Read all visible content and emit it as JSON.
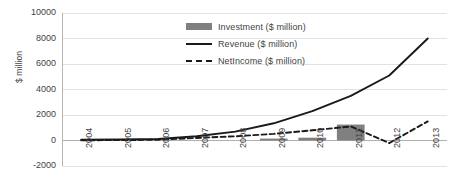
{
  "chart_data": {
    "type": "line",
    "title": "",
    "xlabel": "",
    "ylabel": "$ million",
    "ylim": [
      -2000,
      10000
    ],
    "ytick_step": 2000,
    "grid": true,
    "legend_position": "top-center",
    "categories": [
      "2004",
      "2005",
      "2006",
      "2007",
      "2008",
      "2009",
      "2010",
      "2011",
      "2012",
      "2013"
    ],
    "yticks": [
      "10000",
      "8000",
      "6000",
      "4000",
      "2000",
      "0",
      "-2000"
    ],
    "ytick_values": [
      10000,
      8000,
      6000,
      4000,
      2000,
      0,
      -2000
    ],
    "series": [
      {
        "name": "Investment ($ million)",
        "type": "bar",
        "color": "#808080",
        "values": [
          0,
          0,
          0,
          0,
          0,
          150,
          220,
          1250,
          0,
          0
        ]
      },
      {
        "name": "Revenue ($ million)",
        "type": "line",
        "style": "solid",
        "color": "#1a1a1a",
        "values": [
          60,
          80,
          120,
          330,
          700,
          1350,
          2300,
          3500,
          5100,
          8000
        ]
      },
      {
        "name": "NetIncome ($ million)",
        "type": "line",
        "style": "dashed",
        "color": "#1a1a1a",
        "values": [
          20,
          30,
          60,
          200,
          330,
          520,
          800,
          1100,
          -200,
          1500
        ]
      }
    ]
  },
  "legend": {
    "items": [
      {
        "label": "Investment ($ million)",
        "marker": "bar-swatch-icon"
      },
      {
        "label": "Revenue ($ million)",
        "marker": "solid-line-icon"
      },
      {
        "label": "NetIncome ($ million)",
        "marker": "dashed-line-icon"
      }
    ]
  }
}
